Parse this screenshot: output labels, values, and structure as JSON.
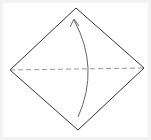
{
  "diagram": {
    "type": "origami-fold-step",
    "canvas": {
      "width": 151,
      "height": 140
    },
    "colors": {
      "background": "#ffffff",
      "frame": "#f2f2f2",
      "paper_outline": "#333333",
      "valley_fold_line": "#8a8a8a",
      "arrow": "#666666"
    },
    "paper": {
      "shape": "square-rotated-45",
      "vertices": {
        "top": [
          76,
          8
        ],
        "right": [
          144,
          68
        ],
        "bottom": [
          78,
          130
        ],
        "left": [
          10,
          70
        ]
      }
    },
    "fold_line": {
      "style": "dashed",
      "kind": "valley-fold",
      "from": [
        10,
        70
      ],
      "to": [
        144,
        68
      ]
    },
    "arrow": {
      "kind": "fold-up",
      "direction": "bottom-to-top",
      "start": [
        78,
        117
      ],
      "control": [
        100,
        68
      ],
      "end": [
        74,
        20
      ],
      "head": "open-chevron"
    }
  }
}
